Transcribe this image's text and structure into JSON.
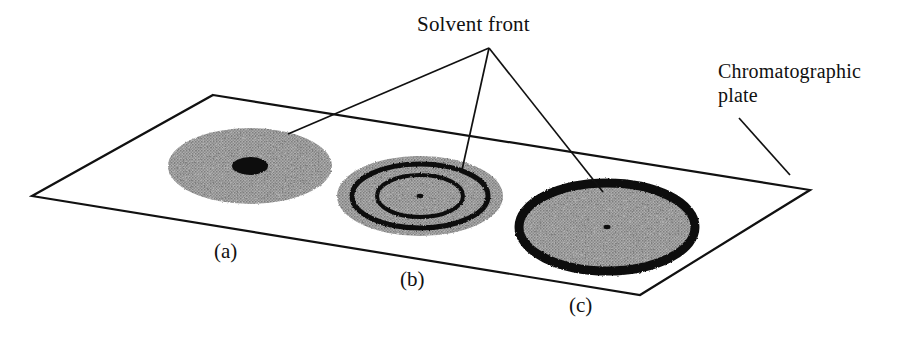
{
  "figure": {
    "background_color": "#ffffff",
    "ink_color": "#111111",
    "spot_fill_color": "#9a9a9a",
    "width": 921,
    "height": 339
  },
  "annotations": {
    "solvent_front": "Solvent front",
    "chromatographic_plate_line1": "Chromatographic",
    "chromatographic_plate_line2": "plate"
  },
  "spots": [
    {
      "id": "a",
      "label": "(a)",
      "description": "diffuse gray spot with small dense black core",
      "center_x": 250,
      "center_y": 166,
      "radius_x": 82,
      "radius_y": 38,
      "core_radius_x": 18,
      "core_radius_y": 9,
      "rings": 0,
      "ring_style": "none"
    },
    {
      "id": "b",
      "label": "(b)",
      "description": "gray spot with two concentric dark rings and pinpoint center",
      "center_x": 420,
      "center_y": 196,
      "radius_x": 83,
      "radius_y": 40,
      "core_radius_x": 3,
      "core_radius_y": 2,
      "rings": 2,
      "ring_style": "concentric"
    },
    {
      "id": "c",
      "label": "(c)",
      "description": "gray spot with thick dark outer rim and pinpoint center",
      "center_x": 607,
      "center_y": 227,
      "radius_x": 88,
      "radius_y": 44,
      "core_radius_x": 3,
      "core_radius_y": 2,
      "rings": 1,
      "ring_style": "thick-rim"
    }
  ],
  "plate": {
    "name": "chromatographic-plate",
    "corners": [
      {
        "x": 213,
        "y": 95
      },
      {
        "x": 810,
        "y": 190
      },
      {
        "x": 640,
        "y": 295
      },
      {
        "x": 32,
        "y": 196
      }
    ]
  },
  "leader_lines": {
    "solvent_front_apex": {
      "x": 489,
      "y": 48
    },
    "targets": [
      {
        "to_spot": "a",
        "x": 288,
        "y": 134
      },
      {
        "to_spot": "b",
        "x": 462,
        "y": 170
      },
      {
        "to_spot": "c",
        "x": 603,
        "y": 192
      }
    ],
    "plate_leader": {
      "x1": 739,
      "y1": 118,
      "x2": 790,
      "y2": 175
    }
  }
}
